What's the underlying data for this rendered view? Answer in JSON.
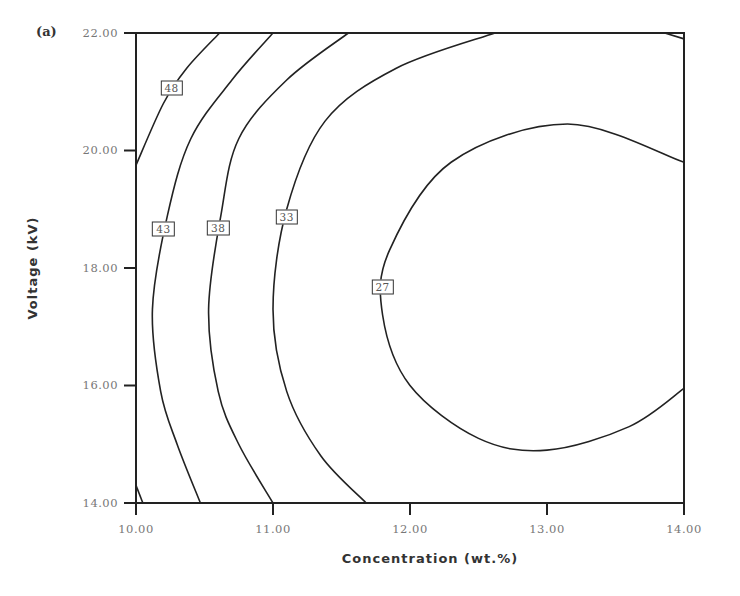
{
  "chart_data": {
    "type": "contour",
    "panel_label": "(a)",
    "title": "",
    "xlabel": "Concentration (wt.%)",
    "ylabel": "Voltage (kV)",
    "xlim": [
      10.0,
      14.0
    ],
    "ylim": [
      14.0,
      22.0
    ],
    "xticks": [
      "10.00",
      "11.00",
      "12.00",
      "13.00",
      "14.00"
    ],
    "yticks": [
      "14.00",
      "16.00",
      "18.00",
      "20.00",
      "22.00"
    ],
    "grid": false,
    "contour_levels": [
      {
        "level": 48,
        "label": "48",
        "label_pos": [
          10.26,
          21.06
        ],
        "points": [
          [
            10.61,
            22.0
          ],
          [
            10.37,
            21.4
          ],
          [
            10.2,
            20.8
          ],
          [
            10.0,
            19.75
          ]
        ]
      },
      {
        "level": 43,
        "label": "43",
        "label_pos": [
          10.2,
          18.66
        ],
        "points": [
          [
            11.0,
            22.0
          ],
          [
            10.7,
            21.2
          ],
          [
            10.4,
            20.2
          ],
          [
            10.23,
            18.9
          ],
          [
            10.12,
            17.3
          ],
          [
            10.18,
            15.9
          ],
          [
            10.3,
            15.0
          ],
          [
            10.47,
            14.0
          ]
        ]
      },
      {
        "level": 38,
        "label": "38",
        "label_pos": [
          10.6,
          18.68
        ],
        "points": [
          [
            11.55,
            22.0
          ],
          [
            11.1,
            21.2
          ],
          [
            10.75,
            20.2
          ],
          [
            10.62,
            18.9
          ],
          [
            10.53,
            17.3
          ],
          [
            10.6,
            15.9
          ],
          [
            10.75,
            15.0
          ],
          [
            11.0,
            14.0
          ]
        ]
      },
      {
        "level": 33,
        "label": "33",
        "label_pos": [
          11.1,
          18.86
        ],
        "points": [
          [
            12.62,
            22.0
          ],
          [
            11.9,
            21.4
          ],
          [
            11.38,
            20.5
          ],
          [
            11.1,
            19.0
          ],
          [
            11.0,
            17.3
          ],
          [
            11.1,
            15.9
          ],
          [
            11.35,
            14.8
          ],
          [
            11.68,
            14.0
          ]
        ]
      },
      {
        "level": 27,
        "label": "27",
        "label_pos": [
          11.8,
          17.68
        ],
        "points": [
          [
            14.0,
            19.8
          ],
          [
            13.15,
            20.45
          ],
          [
            12.3,
            19.8
          ],
          [
            11.85,
            18.3
          ],
          [
            11.8,
            17.2
          ],
          [
            12.0,
            16.0
          ],
          [
            12.5,
            15.1
          ],
          [
            13.0,
            14.9
          ],
          [
            13.6,
            15.3
          ],
          [
            14.0,
            15.95
          ]
        ]
      },
      {
        "level": 48,
        "label": "",
        "note": "corner fragment bottom-left",
        "points": [
          [
            10.0,
            14.3
          ],
          [
            10.05,
            14.0
          ]
        ]
      },
      {
        "level": 27,
        "label": "",
        "note": "corner fragment top-right",
        "points": [
          [
            13.86,
            22.0
          ],
          [
            14.0,
            21.9
          ]
        ]
      }
    ]
  }
}
